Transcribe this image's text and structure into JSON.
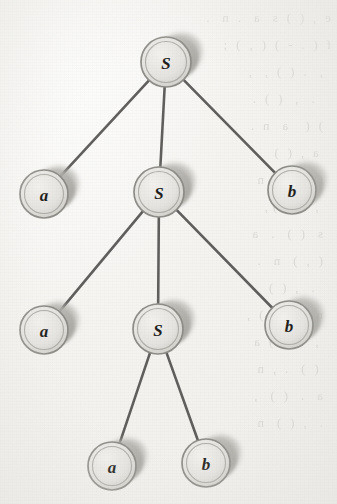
{
  "figure": {
    "kind": "parse-tree",
    "caption": "",
    "background_color": "#f2f1ee",
    "edge_color": "#4c4a48",
    "node_face_color": "#e7e6e2",
    "node_edge_color": "#8e8c87",
    "node_shadow_color": "#a9a7a2",
    "label_color": "#1f1e1c"
  },
  "tree": {
    "root_id": "n0",
    "nodes": [
      {
        "id": "n0",
        "label": "S",
        "x": 166,
        "y": 62,
        "r": 25,
        "level": 0,
        "kind": "nonterminal"
      },
      {
        "id": "n1",
        "label": "a",
        "x": 44,
        "y": 194,
        "r": 24,
        "level": 1,
        "kind": "terminal"
      },
      {
        "id": "n2",
        "label": "S",
        "x": 159,
        "y": 192,
        "r": 25,
        "level": 1,
        "kind": "nonterminal"
      },
      {
        "id": "n3",
        "label": "b",
        "x": 292,
        "y": 190,
        "r": 24,
        "level": 1,
        "kind": "terminal"
      },
      {
        "id": "n4",
        "label": "a",
        "x": 44,
        "y": 330,
        "r": 24,
        "level": 2,
        "kind": "terminal"
      },
      {
        "id": "n5",
        "label": "S",
        "x": 158,
        "y": 329,
        "r": 25,
        "level": 2,
        "kind": "nonterminal"
      },
      {
        "id": "n6",
        "label": "b",
        "x": 289,
        "y": 325,
        "r": 24,
        "level": 2,
        "kind": "terminal"
      },
      {
        "id": "n7",
        "label": "a",
        "x": 112,
        "y": 466,
        "r": 24,
        "level": 3,
        "kind": "terminal"
      },
      {
        "id": "n8",
        "label": "b",
        "x": 206,
        "y": 463,
        "r": 24,
        "level": 3,
        "kind": "terminal"
      }
    ],
    "edges": [
      {
        "id": "e0",
        "from": "n0",
        "to": "n1"
      },
      {
        "id": "e1",
        "from": "n0",
        "to": "n2"
      },
      {
        "id": "e2",
        "from": "n0",
        "to": "n3"
      },
      {
        "id": "e3",
        "from": "n2",
        "to": "n4"
      },
      {
        "id": "e4",
        "from": "n2",
        "to": "n5"
      },
      {
        "id": "e5",
        "from": "n2",
        "to": "n6"
      },
      {
        "id": "e6",
        "from": "n5",
        "to": "n7"
      },
      {
        "id": "e7",
        "from": "n5",
        "to": "n8"
      }
    ]
  },
  "bleedthrough": {
    "note": "faint mirrored text from the reverse side of the scanned page (illegible)",
    "lines": [
      "e  ,  (  )  s   a   .  n   .  ",
      "f  (  .  -  )  (  ,  )  ;  ",
      "  ,   .  (  )  ,   ,   ",
      "    .   ,   (  )  .  ",
      "  )  (    a   n  .   ",
      "   a  ,  (  )   .   ",
      "  (  .  )    ,  n   ",
      "   ,  .   (  ) ,  ",
      "  s   (  )   .   a   ",
      "  (  ,  )   n   .   ",
      "    .   ,  (  )   ",
      "  n   a  .  (  )  ,  ",
      "   ,   .   (  )  a  ",
      "   (  )   .  ,  n   ",
      "  a   .   (  )   ,   ",
      "  .   ,  (  )   n   "
    ]
  }
}
